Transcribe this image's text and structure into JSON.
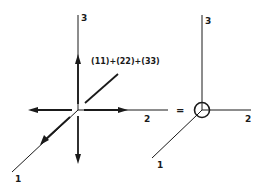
{
  "diagram": {
    "left": {
      "axis_labels": {
        "axis1": "1",
        "axis2": "2",
        "axis3": "3"
      },
      "annotation": "(11)+(22)+(33)"
    },
    "operator": "=",
    "right": {
      "axis_labels": {
        "axis1": "1",
        "axis2": "2",
        "axis3": "3"
      },
      "origin_symbol": "circle-with-lines"
    }
  }
}
